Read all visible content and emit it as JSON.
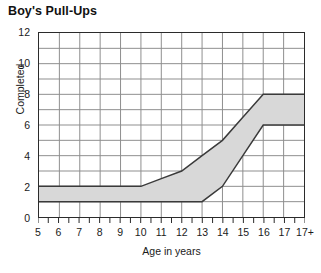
{
  "chart_data": {
    "type": "area",
    "title": "Boy's Pull-Ups",
    "xlabel": "Age in years",
    "ylabel": "Completed",
    "xlim": [
      5,
      18
    ],
    "ylim": [
      0,
      12
    ],
    "grid": true,
    "legend": null,
    "band_fill_color": "#d8d8d8",
    "band_line_color": "#3a3a3a",
    "grid_color": "#8e8e8e",
    "axis_color": "#2b2b2b",
    "x": [
      5,
      6,
      7,
      8,
      9,
      10,
      11,
      12,
      13,
      14,
      15,
      16,
      17,
      18
    ],
    "x_tick_labels": [
      "5",
      "6",
      "7",
      "8",
      "9",
      "10",
      "11",
      "12",
      "13",
      "14",
      "15",
      "16",
      "17",
      "17+"
    ],
    "y_tick_labels": [
      "0",
      "2",
      "4",
      "6",
      "8",
      "10",
      "12"
    ],
    "y_ticks": [
      0,
      2,
      4,
      6,
      8,
      10,
      12
    ],
    "series": [
      {
        "name": "Upper boundary",
        "values": [
          2,
          2,
          2,
          2,
          2,
          2,
          2.5,
          3,
          4,
          5,
          6.5,
          8,
          8,
          8
        ]
      },
      {
        "name": "Lower boundary",
        "values": [
          1,
          1,
          1,
          1,
          1,
          1,
          1,
          1,
          1,
          2,
          4,
          6,
          6,
          6
        ]
      }
    ]
  }
}
